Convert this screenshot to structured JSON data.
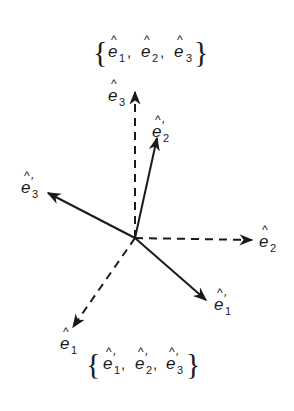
{
  "diagram": {
    "title_top": "{ê1, ê2, ê3}",
    "title_bottom": "{ê'1, ê'2, ê'3}",
    "set_top": {
      "items": [
        {
          "base": "e",
          "hat": "^",
          "sub": "1",
          "prime": ""
        },
        {
          "base": "e",
          "hat": "^",
          "sub": "2",
          "prime": ""
        },
        {
          "base": "e",
          "hat": "^",
          "sub": "3",
          "prime": ""
        }
      ],
      "open": "{",
      "close": "}",
      "sep": ","
    },
    "set_bottom": {
      "items": [
        {
          "base": "e",
          "hat": "^",
          "sub": "1",
          "prime": "′"
        },
        {
          "base": "e",
          "hat": "^",
          "sub": "2",
          "prime": "′"
        },
        {
          "base": "e",
          "hat": "^",
          "sub": "3",
          "prime": "′"
        }
      ],
      "open": "{",
      "close": "}",
      "sep": ","
    },
    "origin": [
      135,
      238
    ],
    "vectors": [
      {
        "id": "e1",
        "style": "dashed",
        "to": [
          73,
          327
        ],
        "label": {
          "base": "e",
          "hat": "^",
          "sub": "1",
          "prime": ""
        }
      },
      {
        "id": "e2",
        "style": "dashed",
        "to": [
          252,
          240
        ],
        "label": {
          "base": "e",
          "hat": "^",
          "sub": "2",
          "prime": ""
        }
      },
      {
        "id": "e3",
        "style": "dashed",
        "to": [
          135,
          92
        ],
        "label": {
          "base": "e",
          "hat": "^",
          "sub": "3",
          "prime": ""
        }
      },
      {
        "id": "e1p",
        "style": "solid",
        "to": [
          206,
          300
        ],
        "label": {
          "base": "e",
          "hat": "^",
          "sub": "1",
          "prime": "′"
        }
      },
      {
        "id": "e2p",
        "style": "solid",
        "to": [
          157,
          138
        ],
        "label": {
          "base": "e",
          "hat": "^",
          "sub": "2",
          "prime": "′"
        }
      },
      {
        "id": "e3p",
        "style": "solid",
        "to": [
          48,
          193
        ],
        "label": {
          "base": "e",
          "hat": "^",
          "sub": "3",
          "prime": "′"
        }
      }
    ],
    "colors": {
      "ink": "#1a1a1a",
      "background": "#ffffff"
    }
  }
}
